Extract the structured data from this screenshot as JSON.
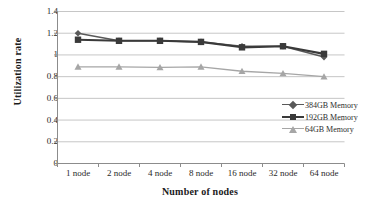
{
  "chart_data": {
    "type": "line",
    "title": "",
    "xlabel": "Number of nodes",
    "ylabel": "Utilization rate",
    "categories": [
      "1 node",
      "2 node",
      "4 node",
      "8 node",
      "16 node",
      "32 node",
      "64 node"
    ],
    "ylim": [
      0,
      1.4
    ],
    "yticks": [
      "0",
      "0.2",
      "0.4",
      "0.6",
      "0.8",
      "1",
      "1.2",
      "1.4"
    ],
    "ytick_values": [
      0,
      0.2,
      0.4,
      0.6,
      0.8,
      1.0,
      1.2,
      1.4
    ],
    "grid": "horizontal",
    "legend_position": "right-inside",
    "series": [
      {
        "name": "384GB Memory",
        "marker": "diamond",
        "color": "#595959",
        "values": [
          1.2,
          1.13,
          1.13,
          1.12,
          1.08,
          1.08,
          0.98
        ]
      },
      {
        "name": "192GB Memory",
        "marker": "square",
        "color": "#3a3a3a",
        "values": [
          1.14,
          1.13,
          1.13,
          1.12,
          1.07,
          1.08,
          1.01
        ]
      },
      {
        "name": "64GB Memory",
        "marker": "triangle",
        "color": "#a6a6a6",
        "values": [
          0.89,
          0.89,
          0.885,
          0.89,
          0.85,
          0.83,
          0.8
        ]
      }
    ]
  },
  "colors": {
    "axis": "#8c8c8c",
    "grid": "#bfbfbf",
    "text": "#2a2a2a",
    "background": "#ffffff"
  }
}
